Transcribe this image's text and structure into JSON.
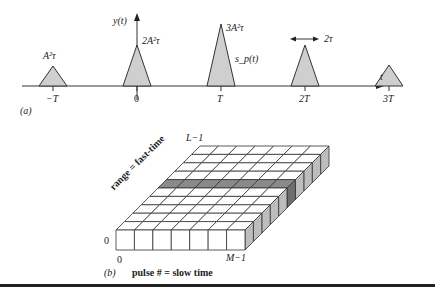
{
  "panel_a": {
    "tag": "(a)",
    "y_axis_label": "y(t)",
    "t_axis_label": "t",
    "ticks": [
      "−T",
      "0",
      "T",
      "2T",
      "3T"
    ],
    "peaks": [
      {
        "at": "−T",
        "label": "A²τ",
        "rel_height": 1
      },
      {
        "at": "0",
        "label": "2A²τ",
        "rel_height": 2
      },
      {
        "at": "T",
        "label": "3A²τ",
        "rel_height": 3
      },
      {
        "at": "2T",
        "label": "",
        "rel_height": 2
      },
      {
        "at": "3T",
        "label": "",
        "rel_height": 1
      }
    ],
    "pulse_label": "s_p(t)",
    "width_annotation": "2τ",
    "fill_color": "#cfcfcf"
  },
  "panel_b": {
    "tag": "(b)",
    "top_label": "L−1",
    "range_label": "range = fast-time",
    "origin_row_label": "0",
    "origin_col_label": "0",
    "last_col_label": "M−1",
    "slow_time_label": "pulse # = slow time",
    "grid_columns": 7,
    "grid_rows": 10,
    "highlight_row": 5,
    "highlight_color": "#8a8a8a",
    "side_color": "#bdbdbd"
  }
}
